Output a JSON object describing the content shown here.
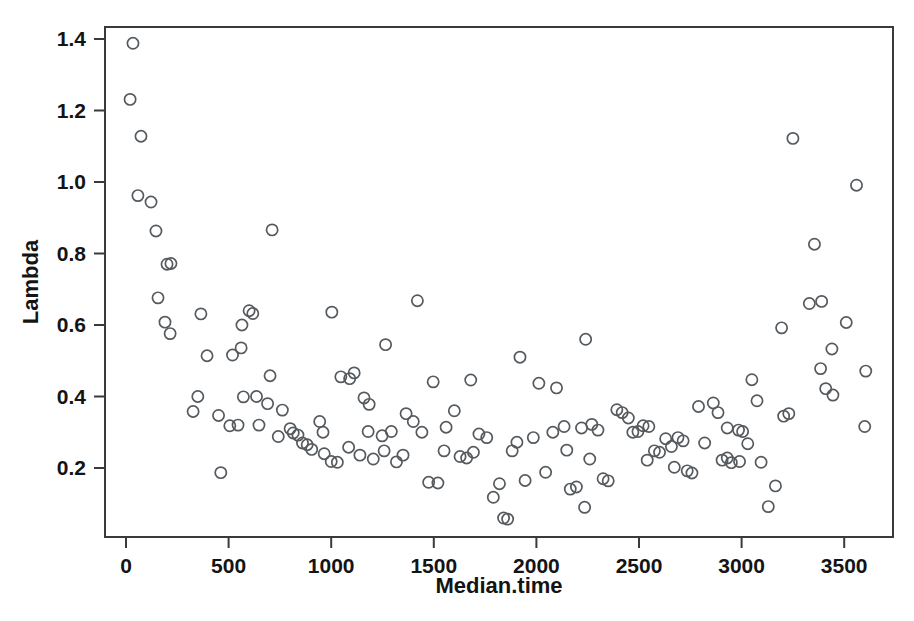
{
  "chart_data": {
    "type": "scatter",
    "title": "",
    "xlabel": "Median.time",
    "ylabel": "Lambda",
    "xlim": [
      -45,
      3690
    ],
    "ylim": [
      0.007,
      1.45
    ],
    "grid": false,
    "legend": "none",
    "marker": "open-circle",
    "marker_color": "#555a5e",
    "xticks": [
      0,
      500,
      1000,
      1500,
      2000,
      2500,
      3000,
      3500
    ],
    "xtick_labels": [
      "0",
      "500",
      "1000",
      "1500",
      "2000",
      "2500",
      "3000",
      "3500"
    ],
    "yticks": [
      0.2,
      0.4,
      0.6,
      0.8,
      1.0,
      1.2,
      1.4
    ],
    "ytick_labels": [
      "0.2",
      "0.4",
      "0.6",
      "0.8",
      "1.0",
      "1.2",
      "1.4"
    ],
    "n_points": 148,
    "points": [
      [
        34,
        1.388
      ],
      [
        20,
        1.231
      ],
      [
        73,
        1.128
      ],
      [
        58,
        0.962
      ],
      [
        122,
        0.944
      ],
      [
        146,
        0.863
      ],
      [
        200,
        0.77
      ],
      [
        219,
        0.772
      ],
      [
        712,
        0.866
      ],
      [
        156,
        0.676
      ],
      [
        190,
        0.608
      ],
      [
        215,
        0.576
      ],
      [
        365,
        0.631
      ],
      [
        600,
        0.64
      ],
      [
        618,
        0.632
      ],
      [
        565,
        0.6
      ],
      [
        1003,
        0.636
      ],
      [
        1420,
        0.668
      ],
      [
        3250,
        1.122
      ],
      [
        3560,
        0.991
      ],
      [
        3355,
        0.826
      ],
      [
        3195,
        0.592
      ],
      [
        3330,
        0.66
      ],
      [
        3390,
        0.666
      ],
      [
        2240,
        0.56
      ],
      [
        1265,
        0.545
      ],
      [
        3510,
        0.607
      ],
      [
        395,
        0.514
      ],
      [
        519,
        0.516
      ],
      [
        561,
        0.536
      ],
      [
        1920,
        0.51
      ],
      [
        3440,
        0.533
      ],
      [
        350,
        0.4
      ],
      [
        327,
        0.358
      ],
      [
        462,
        0.187
      ],
      [
        451,
        0.347
      ],
      [
        572,
        0.399
      ],
      [
        702,
        0.458
      ],
      [
        1047,
        0.455
      ],
      [
        1090,
        0.45
      ],
      [
        1112,
        0.466
      ],
      [
        1185,
        0.378
      ],
      [
        1160,
        0.396
      ],
      [
        1497,
        0.441
      ],
      [
        1680,
        0.446
      ],
      [
        2012,
        0.437
      ],
      [
        2098,
        0.424
      ],
      [
        3385,
        0.478
      ],
      [
        3050,
        0.447
      ],
      [
        3445,
        0.404
      ],
      [
        3410,
        0.422
      ],
      [
        3605,
        0.471
      ],
      [
        506,
        0.318
      ],
      [
        546,
        0.32
      ],
      [
        762,
        0.362
      ],
      [
        800,
        0.31
      ],
      [
        815,
        0.298
      ],
      [
        838,
        0.292
      ],
      [
        860,
        0.27
      ],
      [
        883,
        0.265
      ],
      [
        905,
        0.252
      ],
      [
        944,
        0.33
      ],
      [
        966,
        0.24
      ],
      [
        1000,
        0.218
      ],
      [
        1030,
        0.216
      ],
      [
        1140,
        0.236
      ],
      [
        1205,
        0.225
      ],
      [
        1248,
        0.29
      ],
      [
        1293,
        0.302
      ],
      [
        1318,
        0.217
      ],
      [
        1365,
        0.352
      ],
      [
        1400,
        0.33
      ],
      [
        1442,
        0.3
      ],
      [
        1475,
        0.16
      ],
      [
        1520,
        0.158
      ],
      [
        1560,
        0.314
      ],
      [
        1600,
        0.36
      ],
      [
        1628,
        0.232
      ],
      [
        1660,
        0.228
      ],
      [
        1693,
        0.244
      ],
      [
        1720,
        0.295
      ],
      [
        1758,
        0.285
      ],
      [
        1790,
        0.118
      ],
      [
        1820,
        0.156
      ],
      [
        1840,
        0.06
      ],
      [
        1860,
        0.057
      ],
      [
        1905,
        0.272
      ],
      [
        1945,
        0.165
      ],
      [
        1985,
        0.285
      ],
      [
        2045,
        0.188
      ],
      [
        2080,
        0.3
      ],
      [
        2135,
        0.316
      ],
      [
        2165,
        0.141
      ],
      [
        2195,
        0.147
      ],
      [
        2235,
        0.09
      ],
      [
        2270,
        0.322
      ],
      [
        2300,
        0.306
      ],
      [
        2325,
        0.17
      ],
      [
        2350,
        0.164
      ],
      [
        2392,
        0.363
      ],
      [
        2418,
        0.355
      ],
      [
        2448,
        0.34
      ],
      [
        2470,
        0.3
      ],
      [
        2495,
        0.302
      ],
      [
        2520,
        0.318
      ],
      [
        2548,
        0.316
      ],
      [
        2575,
        0.248
      ],
      [
        2600,
        0.244
      ],
      [
        2630,
        0.282
      ],
      [
        2658,
        0.26
      ],
      [
        2690,
        0.285
      ],
      [
        2715,
        0.276
      ],
      [
        2735,
        0.192
      ],
      [
        2758,
        0.186
      ],
      [
        2790,
        0.372
      ],
      [
        2820,
        0.27
      ],
      [
        2862,
        0.382
      ],
      [
        2885,
        0.355
      ],
      [
        2905,
        0.222
      ],
      [
        2930,
        0.228
      ],
      [
        2950,
        0.215
      ],
      [
        2985,
        0.306
      ],
      [
        3005,
        0.302
      ],
      [
        3030,
        0.268
      ],
      [
        3075,
        0.388
      ],
      [
        3095,
        0.216
      ],
      [
        3130,
        0.092
      ],
      [
        3165,
        0.15
      ],
      [
        3205,
        0.345
      ],
      [
        3230,
        0.352
      ],
      [
        3600,
        0.316
      ],
      [
        636,
        0.4
      ],
      [
        690,
        0.38
      ],
      [
        742,
        0.288
      ],
      [
        1085,
        0.258
      ],
      [
        1258,
        0.248
      ],
      [
        2148,
        0.25
      ],
      [
        2220,
        0.312
      ],
      [
        2540,
        0.222
      ],
      [
        2672,
        0.202
      ],
      [
        2930,
        0.312
      ],
      [
        1882,
        0.248
      ],
      [
        2260,
        0.225
      ],
      [
        1350,
        0.236
      ],
      [
        1550,
        0.248
      ],
      [
        960,
        0.3
      ],
      [
        1180,
        0.302
      ],
      [
        648,
        0.32
      ],
      [
        2990,
        0.218
      ]
    ]
  },
  "axes": {
    "x_axis_name": "Median.time",
    "y_axis_name": "Lambda"
  }
}
